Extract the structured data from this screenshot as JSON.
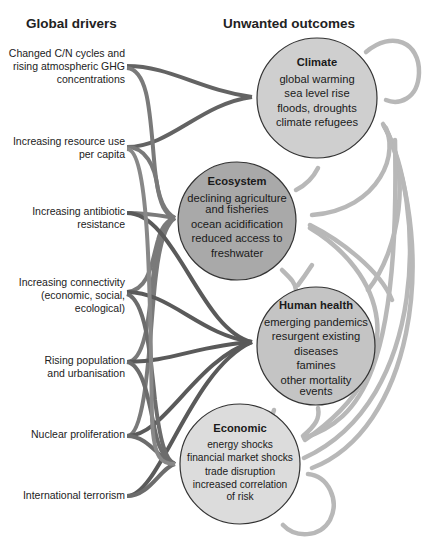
{
  "headings": {
    "drivers": "Global drivers",
    "outcomes": "Unwanted outcomes"
  },
  "drivers": [
    {
      "lines": [
        "Changed C/N cycles and",
        "rising atmospheric GHG",
        "concentrations"
      ]
    },
    {
      "lines": [
        "Increasing resource use",
        "per capita"
      ]
    },
    {
      "lines": [
        "Increasing antibiotic",
        "resistance"
      ]
    },
    {
      "lines": [
        "Increasing connectivity",
        "(economic, social,",
        "ecological)"
      ]
    },
    {
      "lines": [
        "Rising population",
        "and urbanisation"
      ]
    },
    {
      "lines": [
        "Nuclear proliferation"
      ]
    },
    {
      "lines": [
        "International terrorism"
      ]
    }
  ],
  "outcomes": [
    {
      "title": "Climate",
      "items": [
        "global warming",
        "sea level rise",
        "floods, droughts",
        "climate refugees"
      ]
    },
    {
      "title": "Ecosystem",
      "items": [
        "declining agriculture",
        "and fisheries",
        "ocean acidification",
        "reduced access to",
        "freshwater"
      ]
    },
    {
      "title": "Human health",
      "items": [
        "emerging pandemics",
        "resurgent existing",
        "diseases",
        "famines",
        "other mortality",
        "events"
      ]
    },
    {
      "title": "Economic",
      "items": [
        "energy shocks",
        "financial market shocks",
        "trade disruption",
        "increased correlation",
        "of risk"
      ]
    }
  ],
  "colors": {
    "climate_fill": "#cfcfcf",
    "ecosystem_fill": "#a9a9a9",
    "health_fill": "#c4c4c4",
    "economic_fill": "#dcdcdc",
    "circle_stroke": "#333333",
    "driver_link_dark": "#5e5e5e",
    "driver_link_mid": "#7e7e7e",
    "feedback_link": "#b8b8b8"
  }
}
